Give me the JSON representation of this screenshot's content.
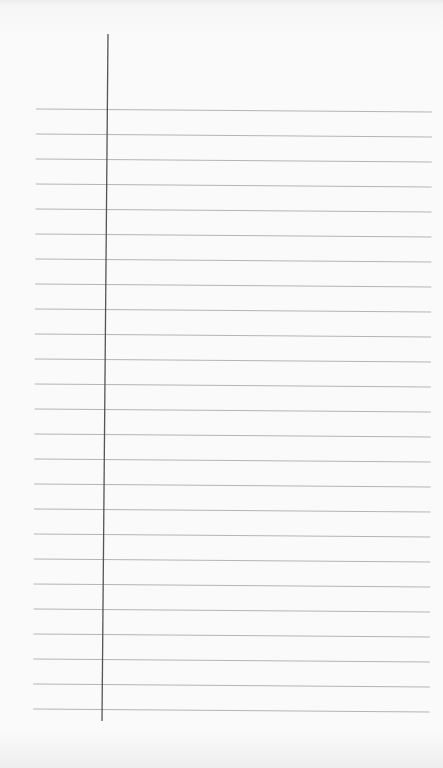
{
  "page": {
    "type": "lined-notepad-sheet",
    "background_color": "#fafafa",
    "rule_color": "#b4b4b4",
    "margin_color": "#555555",
    "rule_count": 25,
    "rule_spacing_px": 25,
    "first_rule_y": 109,
    "rule_left_x": 36,
    "rule_right_x": 432,
    "rule_slope_px": 3,
    "margin_line": {
      "top": [
        108,
        34
      ],
      "bottom": [
        102,
        721
      ]
    }
  }
}
